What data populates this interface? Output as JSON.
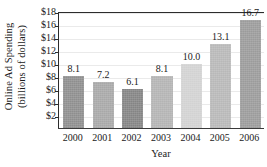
{
  "chart_data": {
    "type": "bar",
    "title": "",
    "subtitle": "",
    "xlabel": "Year",
    "ylabel_line1": "Online Ad Spending",
    "ylabel_line2": "(billions of dollars)",
    "ylabel": "Online Ad Spending (billions of dollars)",
    "categories": [
      "2000",
      "2001",
      "2002",
      "2003",
      "2004",
      "2005",
      "2006"
    ],
    "values": [
      8.1,
      7.2,
      6.1,
      8.1,
      10.0,
      13.1,
      16.7
    ],
    "value_labels": [
      "8.1",
      "7.2",
      "6.1",
      "8.1",
      "10.0",
      "13.1",
      "16.7"
    ],
    "bar_colors": [
      "#8e8e8e",
      "#a8a8a8",
      "#848484",
      "#b4b4b4",
      "#d2d2d2",
      "#b8b8b8",
      "#9b9b9b"
    ],
    "ylim": [
      0,
      18
    ],
    "yticks": [
      2,
      4,
      6,
      8,
      10,
      12,
      14,
      16,
      18
    ],
    "ytick_labels": [
      "$2",
      "$4",
      "$6",
      "$8",
      "$10",
      "$12",
      "$14",
      "$16",
      "$18"
    ],
    "grid": true,
    "grid_color": "#eaeaea",
    "legend": null,
    "axis_color": "#2c2c2c",
    "text_color": "#1b1b1b",
    "background": "#ffffff"
  }
}
